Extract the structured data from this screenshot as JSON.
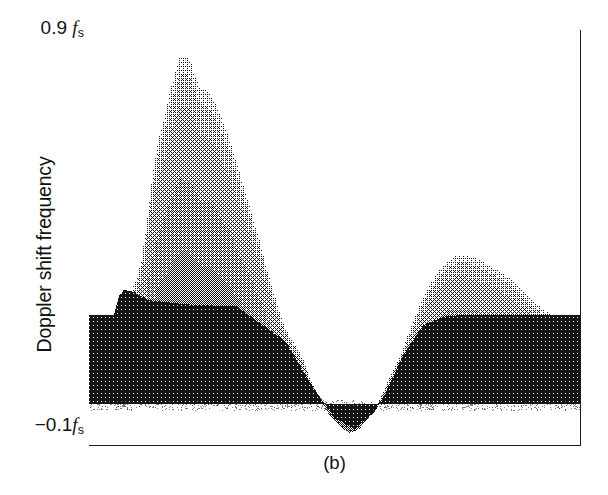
{
  "figure": {
    "caption": "(b)",
    "y_axis_title": "Doppler shift frequency",
    "y_tick_top_value": "0.9",
    "y_tick_top_unit": "f",
    "y_tick_top_sub": "s",
    "y_tick_bottom_value": "−0.1",
    "y_tick_bottom_unit": "f",
    "y_tick_bottom_sub": "s",
    "colors": {
      "ink": "#1b1b1b",
      "paper": "#ffffff",
      "dark_band": "#151515",
      "mid_gray": "#8a8a8a",
      "light_gray": "#b8b8b8"
    }
  },
  "chart_data": {
    "type": "area",
    "title": "",
    "subtitle": "",
    "xlabel": "",
    "ylabel": "Doppler shift frequency",
    "ylim": [
      -0.1,
      0.9
    ],
    "xlim": [
      0,
      1
    ],
    "grid": false,
    "legend": "none",
    "y_ticks": [
      -0.1,
      0.9
    ],
    "y_tick_labels": [
      "-0.1 f_s",
      "0.9 f_s"
    ],
    "x_ticks": [],
    "x_tick_labels": [],
    "annotations": [
      "(b)"
    ],
    "series": [
      {
        "name": "maximum envelope (upper edge of gray spectral band)",
        "x": [
          0.0,
          0.02,
          0.04,
          0.055,
          0.065,
          0.075,
          0.085,
          0.095,
          0.105,
          0.115,
          0.125,
          0.135,
          0.145,
          0.155,
          0.165,
          0.175,
          0.185,
          0.195,
          0.205,
          0.215,
          0.225,
          0.235,
          0.245,
          0.255,
          0.265,
          0.275,
          0.285,
          0.295,
          0.305,
          0.315,
          0.325,
          0.335,
          0.345,
          0.355,
          0.365,
          0.375,
          0.385,
          0.395,
          0.405,
          0.415,
          0.425,
          0.435,
          0.45,
          0.47,
          0.49,
          0.51,
          0.53,
          0.55,
          0.57,
          0.59,
          0.61,
          0.63,
          0.65,
          0.67,
          0.69,
          0.71,
          0.73,
          0.75,
          0.78,
          0.82,
          0.86,
          0.9,
          0.94,
          0.97,
          1.0
        ],
        "y": [
          0.16,
          0.16,
          0.165,
          0.175,
          0.23,
          0.25,
          0.27,
          0.3,
          0.34,
          0.42,
          0.52,
          0.6,
          0.66,
          0.7,
          0.76,
          0.8,
          0.84,
          0.835,
          0.83,
          0.79,
          0.76,
          0.76,
          0.745,
          0.73,
          0.7,
          0.67,
          0.64,
          0.6,
          0.56,
          0.52,
          0.48,
          0.44,
          0.4,
          0.355,
          0.31,
          0.27,
          0.23,
          0.195,
          0.17,
          0.15,
          0.13,
          0.11,
          0.06,
          0.01,
          -0.03,
          -0.055,
          -0.07,
          -0.06,
          -0.03,
          0.01,
          0.06,
          0.11,
          0.17,
          0.23,
          0.28,
          0.32,
          0.345,
          0.36,
          0.355,
          0.33,
          0.3,
          0.25,
          0.215,
          0.205,
          0.2
        ]
      },
      {
        "name": "dark low-frequency band upper edge",
        "x": [
          0.0,
          0.05,
          0.06,
          0.07,
          0.09,
          0.12,
          0.2,
          0.3,
          0.4,
          0.45,
          0.5,
          0.54,
          0.58,
          0.6,
          0.64,
          0.68,
          0.7,
          0.72,
          0.76,
          0.8,
          0.9,
          1.0
        ],
        "y": [
          0.215,
          0.215,
          0.26,
          0.275,
          0.27,
          0.25,
          0.24,
          0.235,
          0.15,
          0.05,
          -0.035,
          -0.06,
          -0.02,
          0.02,
          0.12,
          0.19,
          0.2,
          0.21,
          0.215,
          0.215,
          0.215,
          0.215
        ]
      },
      {
        "name": "baseline (zero Doppler shift)",
        "x": [
          0.0,
          1.0
        ],
        "y": [
          0.0,
          0.0
        ]
      }
    ],
    "peaks": [
      {
        "label": "primary aliased systolic peak",
        "x": 0.185,
        "y": 0.84
      },
      {
        "label": "negative dip minimum",
        "x": 0.53,
        "y": -0.07
      },
      {
        "label": "secondary diastolic hump",
        "x": 0.75,
        "y": 0.36
      }
    ]
  }
}
